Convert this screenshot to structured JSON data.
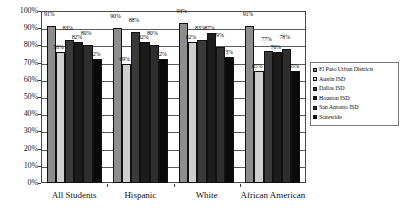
{
  "chart_data": {
    "type": "bar",
    "title": "",
    "xlabel": "",
    "ylabel": "",
    "ylim": [
      0,
      100
    ],
    "grid": true,
    "legend_position": "right",
    "categories": [
      "All Students",
      "Hispanic",
      "White",
      "African American"
    ],
    "ytick_labels": [
      "100%",
      "90%",
      "80%",
      "70%",
      "60%",
      "50%",
      "40%",
      "30%",
      "20%",
      "10%",
      "0%"
    ],
    "ytick_values": [
      100,
      90,
      80,
      70,
      60,
      50,
      40,
      30,
      20,
      10,
      0
    ],
    "series": [
      {
        "name": "El Paso Urban Districts",
        "color": "#8d8d8d",
        "values": [
          91,
          90,
          93,
          91
        ],
        "labels": [
          "91%",
          "90%",
          "93%",
          "91%"
        ]
      },
      {
        "name": "Austin ISD",
        "color": "#cfcfcf",
        "values": [
          76,
          69,
          82,
          65
        ],
        "labels": [
          "76%",
          "69%",
          "82%",
          "65%"
        ]
      },
      {
        "name": "Dallas ISD",
        "color": "#3a3a3a",
        "values": [
          83,
          88,
          83,
          77
        ],
        "labels": [
          "83%",
          "88%",
          "83%",
          "77%"
        ]
      },
      {
        "name": "Houston ISD",
        "color": "#1c1c1c",
        "values": [
          82,
          82,
          87,
          76
        ],
        "labels": [
          "82%",
          "82%",
          "87%",
          "76%"
        ]
      },
      {
        "name": "San Antonio ISD",
        "color": "#2e2e2e",
        "values": [
          80,
          80,
          79,
          78
        ],
        "labels": [
          "80%",
          "80%",
          "79%",
          "78%"
        ]
      },
      {
        "name": "Statewide",
        "color": "#0a0a0a",
        "values": [
          72,
          72,
          73,
          65
        ],
        "labels": [
          "72%",
          "72%",
          "73%",
          "65%"
        ]
      }
    ]
  }
}
